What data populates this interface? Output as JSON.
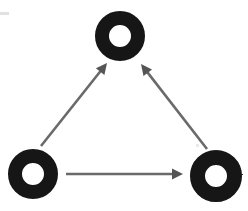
{
  "canvas": {
    "width": 248,
    "height": 211,
    "background": "#ffffff"
  },
  "palette": {
    "ring_color": "#141414",
    "ring_hole_color": "#ffffff",
    "arrow_color": "#6a6a6a",
    "arrow_color_dark": "#555555",
    "background": "#ffffff"
  },
  "chart_data": {
    "type": "diagram",
    "title": "",
    "subtitle": "",
    "node_shape": "ring",
    "nodes": [
      {
        "id": "top-ring",
        "label": "",
        "cx": 120,
        "cy": 36,
        "outer_radius": 25,
        "inner_radius": 11,
        "stroke_width": 14,
        "color": "#141414"
      },
      {
        "id": "bottom-left-ring",
        "label": "",
        "cx": 33,
        "cy": 174,
        "outer_radius": 25,
        "inner_radius": 11,
        "stroke_width": 14,
        "color": "#141414"
      },
      {
        "id": "bottom-right-ring",
        "label": "",
        "cx": 216,
        "cy": 176,
        "outer_radius": 26,
        "inner_radius": 11,
        "stroke_width": 15,
        "color": "#141414"
      }
    ],
    "edges": [
      {
        "id": "edge-left-to-top",
        "from": "bottom-left-ring",
        "to": "top-ring",
        "label": "",
        "directed": true,
        "x1": 41,
        "y1": 146,
        "x2": 107,
        "y2": 63,
        "stroke_width": 2.6,
        "color": "#6a6a6a"
      },
      {
        "id": "edge-right-to-top",
        "from": "bottom-right-ring",
        "to": "top-ring",
        "label": "",
        "directed": true,
        "x1": 207,
        "y1": 149,
        "x2": 141,
        "y2": 64,
        "stroke_width": 2.6,
        "color": "#6a6a6a"
      },
      {
        "id": "edge-left-to-right",
        "from": "bottom-left-ring",
        "to": "bottom-right-ring",
        "label": "",
        "directed": true,
        "x1": 66,
        "y1": 174,
        "x2": 183,
        "y2": 174,
        "stroke_width": 2.6,
        "color": "#6a6a6a"
      }
    ],
    "legend": [],
    "annotations": [],
    "axis_labels": {
      "x": "",
      "y": ""
    },
    "grid": false,
    "legend_position": "none"
  }
}
